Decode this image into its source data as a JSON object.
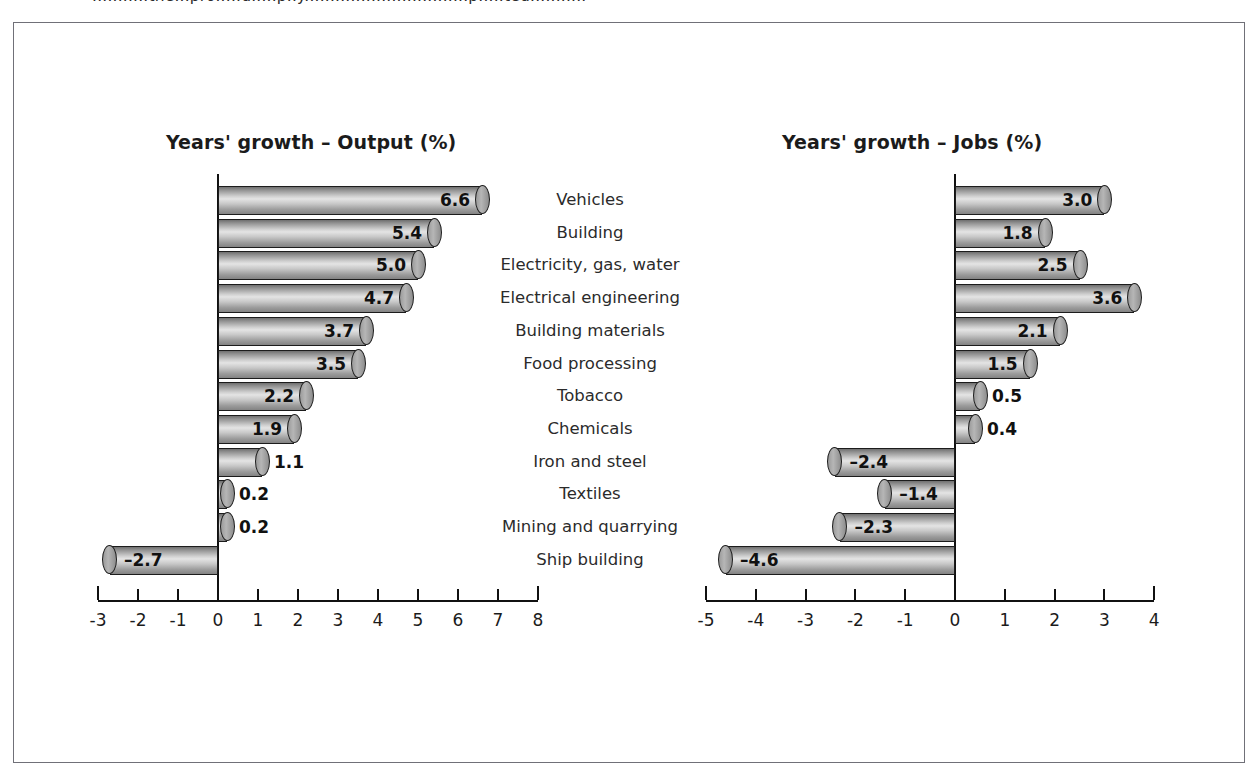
{
  "page": {
    "top_cutoff_text": "...........the...pro.....d.....p..y................................p.....ted...........",
    "frame": {
      "border_color": "#707078",
      "background": "#ffffff"
    }
  },
  "chart_data": [
    {
      "id": "output",
      "type": "bar",
      "orientation": "horizontal",
      "title": "Years' growth – Output (%)",
      "xlabel": "",
      "ylabel": "",
      "grid": false,
      "legend": "none",
      "xlim": [
        -3,
        8
      ],
      "xticks": [
        -3,
        -2,
        -1,
        0,
        1,
        2,
        3,
        4,
        5,
        6,
        7,
        8
      ],
      "xtick_labels": [
        "-3",
        "-2",
        "-1",
        "0",
        "1",
        "2",
        "3",
        "4",
        "5",
        "6",
        "7",
        "8"
      ],
      "categories": [
        "Vehicles",
        "Building",
        "Electricity, gas, water",
        "Electrical engineering",
        "Building materials",
        "Food processing",
        "Tobacco",
        "Chemicals",
        "Iron and steel",
        "Textiles",
        "Mining and quarrying",
        "Ship building"
      ],
      "values": [
        6.6,
        5.4,
        5.0,
        4.7,
        3.7,
        3.5,
        2.2,
        1.9,
        1.1,
        0.2,
        0.2,
        -2.7
      ],
      "value_labels": [
        "6.6",
        "5.4",
        "5.0",
        "4.7",
        "3.7",
        "3.5",
        "2.2",
        "1.9",
        "1.1",
        "0.2",
        "0.2",
        "–2.7"
      ]
    },
    {
      "id": "jobs",
      "type": "bar",
      "orientation": "horizontal",
      "title": "Years' growth – Jobs (%)",
      "xlabel": "",
      "ylabel": "",
      "grid": false,
      "legend": "none",
      "xlim": [
        -5,
        4
      ],
      "xticks": [
        -5,
        -4,
        -3,
        -2,
        -1,
        0,
        1,
        2,
        3,
        4
      ],
      "xtick_labels": [
        "-5",
        "-4",
        "-3",
        "-2",
        "-1",
        "0",
        "1",
        "2",
        "3",
        "4"
      ],
      "categories": [
        "Vehicles",
        "Building",
        "Electricity, gas, water",
        "Electrical engineering",
        "Building materials",
        "Food processing",
        "Tobacco",
        "Chemicals",
        "Iron and steel",
        "Textiles",
        "Mining and quarrying",
        "Ship building"
      ],
      "values": [
        3.0,
        1.8,
        2.5,
        3.6,
        2.1,
        1.5,
        0.5,
        0.4,
        -2.4,
        -1.4,
        -2.3,
        -4.6
      ],
      "value_labels": [
        "3.0",
        "1.8",
        "2.5",
        "3.6",
        "2.1",
        "1.5",
        "0.5",
        "0.4",
        "–2.4",
        "–1.4",
        "–2.3",
        "–4.6"
      ]
    }
  ],
  "style": {
    "bar_outline": "#1c1c1c",
    "bar_light": "#e4e4e4",
    "bar_dark": "#6f6f6f",
    "axis_color": "#111111",
    "text_color": "#1b1b1b"
  },
  "layout": {
    "output": {
      "zero_x": 218,
      "unit_px": 40.0,
      "axis_y": 600,
      "title_left": 166
    },
    "jobs": {
      "zero_x": 955,
      "unit_px": 49.8,
      "axis_y": 600,
      "title_left": 782
    },
    "rows_top": 186,
    "row_step": 32.7,
    "bar_height": 29,
    "center_labels_x": 590
  }
}
